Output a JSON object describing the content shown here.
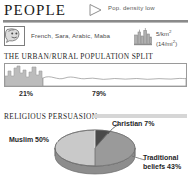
{
  "header": {
    "title": "PEOPLE",
    "triangle_icon": "triangle-right-icon",
    "note": "Pop. density low"
  },
  "facts": {
    "language_icon": "speaking-head-icon",
    "languages": "French, Sara, Arabic, Maba",
    "density_icon": "city-buildings-icon",
    "density_metric": "5/km",
    "density_metric_sup": "2",
    "density_imperial": "(14/mi",
    "density_imperial_sup": "2",
    "density_imperial_close": ")"
  },
  "urban_rural": {
    "title": "THE URBAN/RURAL POPULATION SPLIT",
    "urban_label": "21%",
    "rural_label": "79%",
    "urban_value": 21,
    "rural_value": 79
  },
  "religion": {
    "title": "RELIGIOUS PERSUASION"
  },
  "chart_data": {
    "type": "pie",
    "title": "RELIGIOUS PERSUASION",
    "categories": [
      "Muslim",
      "Christian",
      "Traditional beliefs"
    ],
    "values": [
      50,
      7,
      43
    ],
    "labels": [
      "Muslim 50%",
      "Christian 7%",
      "Traditional beliefs 43%"
    ],
    "colors": [
      "#c9c9c9",
      "#4a4a4a",
      "#9a9a9a"
    ],
    "unit": "percent",
    "legend": "inline-callouts",
    "style": "3d-ellipse"
  },
  "colors": {
    "rule": "#8a8a8a",
    "text": "#2b2b2b",
    "muted": "#595959",
    "section_rule": "#d6d6d6",
    "skyline": "#b5b5b5"
  }
}
